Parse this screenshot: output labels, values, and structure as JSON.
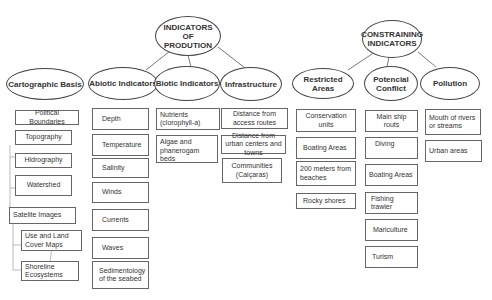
{
  "title_nodes": {
    "production": "INDICATORS OF PRODUTION",
    "constraining": "CONSTRAINING INDICATORS"
  },
  "categories": {
    "cartographic": "Cartographic Basis",
    "abiotic": "Abiotic Indicators",
    "biotic": "Biotic Indicators",
    "infrastructure": "Infrastructure",
    "restricted": "Restricted Areas",
    "conflict": "Potencial Conflict",
    "pollution": "Pollution"
  },
  "cartographic_items": [
    "Political Boundaries",
    "Topography",
    "Hidrography",
    "Watershed",
    "Satelite Images",
    "Use and Land Cover Maps",
    "Shoreline Ecosystems"
  ],
  "abiotic_items": [
    "Depth",
    "Temperature",
    "Salinity",
    "Winds",
    "Currents",
    "Waves",
    "Sedimentology of the seabed"
  ],
  "biotic_items": [
    "Nutrients (clorophyll-a)",
    "Algae and phanerogam beds"
  ],
  "infrastructure_items": [
    "Distance from access routes",
    "Distance from urban centers and towns",
    "Communities (Caiçaras)"
  ],
  "restricted_items": [
    "Conservation units",
    "Boating Areas",
    "200 meters from beaches",
    "Rocky shores"
  ],
  "conflict_items": [
    "Main ship routs",
    "Diving",
    "Boating Areas",
    "Fishing trawler",
    "Mariculture",
    "Turism"
  ],
  "pollution_items": [
    "Mouth of rivers or streams",
    "Urban areas"
  ]
}
